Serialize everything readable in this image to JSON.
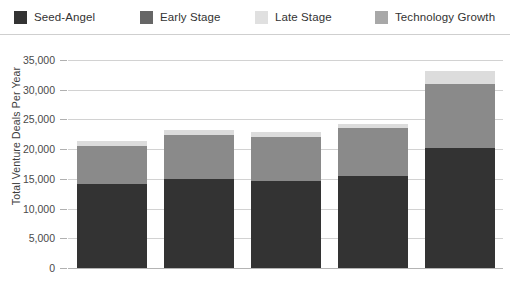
{
  "legend": {
    "items": [
      {
        "label": "Seed-Angel",
        "color": "#333333",
        "swatch_icon": "legend-swatch-icon"
      },
      {
        "label": "Early Stage",
        "color": "#666666",
        "swatch_icon": "legend-swatch-icon"
      },
      {
        "label": "Late Stage",
        "color": "#e0e0e0",
        "swatch_icon": "legend-swatch-icon"
      },
      {
        "label": "Technology Growth",
        "color": "#a8a8a8",
        "swatch_icon": "legend-swatch-icon"
      }
    ]
  },
  "axes": {
    "ylabel": "Total Venture Deals Per Year",
    "yticks": [
      "0",
      "5,000",
      "10,000",
      "15,000",
      "20,000",
      "25,000",
      "30,000",
      "35,000"
    ],
    "ytick_values": [
      0,
      5000,
      10000,
      15000,
      20000,
      25000,
      30000,
      35000
    ],
    "xticks": [
      "2014",
      "2015",
      "2016",
      "2017",
      "2018"
    ]
  },
  "chart_data": {
    "type": "bar",
    "stacked": true,
    "title": "",
    "xlabel": "",
    "ylabel": "Total Venture Deals Per Year",
    "categories": [
      "2014",
      "2015",
      "2016",
      "2017",
      "2018"
    ],
    "series": [
      {
        "name": "Seed-Angel",
        "color": "#333333",
        "values": [
          14200,
          15000,
          14600,
          15500,
          20200
        ]
      },
      {
        "name": "Early Stage",
        "color": "#8a8a8a",
        "values": [
          6300,
          7300,
          7500,
          8000,
          10800
        ]
      },
      {
        "name": "Late Stage",
        "color": "#dcdcdc",
        "values": [
          900,
          900,
          800,
          700,
          2200
        ]
      },
      {
        "name": "Technology Growth",
        "color": "#a8a8a8",
        "values": [
          0,
          0,
          0,
          0,
          0
        ]
      }
    ],
    "totals": [
      21400,
      23200,
      22900,
      24200,
      33200
    ],
    "ylim": [
      0,
      35000
    ],
    "ytick_step": 5000,
    "grid": true,
    "legend_position": "top"
  }
}
